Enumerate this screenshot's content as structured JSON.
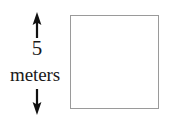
{
  "figure": {
    "type": "geometry-diagram",
    "background_color": "#ffffff",
    "shape": {
      "name": "square",
      "outline_color": "#9a9a9a",
      "fill_color": "#ffffff"
    },
    "dimension": {
      "orientation": "vertical",
      "value": "5",
      "unit": "meters",
      "text_color": "#1a1a1a",
      "arrow_color": "#111111",
      "arrow_up": "arrow-up-icon",
      "arrow_down": "arrow-down-icon"
    }
  }
}
